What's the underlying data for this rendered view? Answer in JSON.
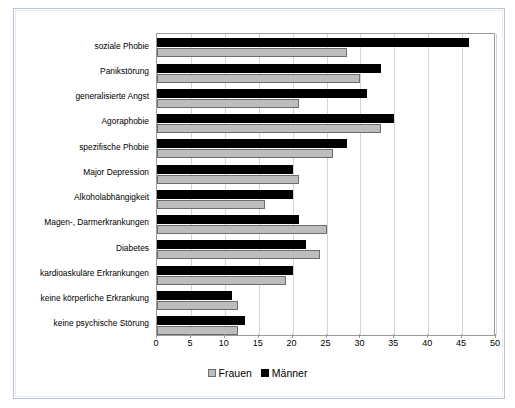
{
  "chart_data": {
    "type": "bar",
    "orientation": "horizontal",
    "title": "",
    "xlabel": "",
    "ylabel": "",
    "xlim": [
      0,
      50
    ],
    "xticks": [
      0,
      5,
      10,
      15,
      20,
      25,
      30,
      35,
      40,
      45,
      50
    ],
    "grid": true,
    "legend_position": "bottom-center",
    "categories": [
      "soziale Phobie",
      "Panikstörung",
      "generalisierte Angst",
      "Agoraphobie",
      "spezifische Phobie",
      "Major Depression",
      "Alkoholabhängigkeit",
      "Magen-, Darmerkrankungen",
      "Diabetes",
      "kardioaskuläre Erkrankungen",
      "keine körperliche Erkrankung",
      "keine psychische Störung"
    ],
    "series": [
      {
        "name": "Frauen",
        "color": "#bdbdbd",
        "values": [
          28,
          30,
          21,
          33,
          26,
          21,
          16,
          25,
          24,
          19,
          12,
          12
        ]
      },
      {
        "name": "Männer",
        "color": "#000000",
        "values": [
          46,
          33,
          31,
          35,
          28,
          20,
          20,
          21,
          22,
          20,
          11,
          13
        ]
      }
    ]
  },
  "legend": {
    "items": [
      {
        "label": "Frauen",
        "swatch": "frauen-swatch"
      },
      {
        "label": "Männer",
        "swatch": "maenner-swatch"
      }
    ]
  }
}
